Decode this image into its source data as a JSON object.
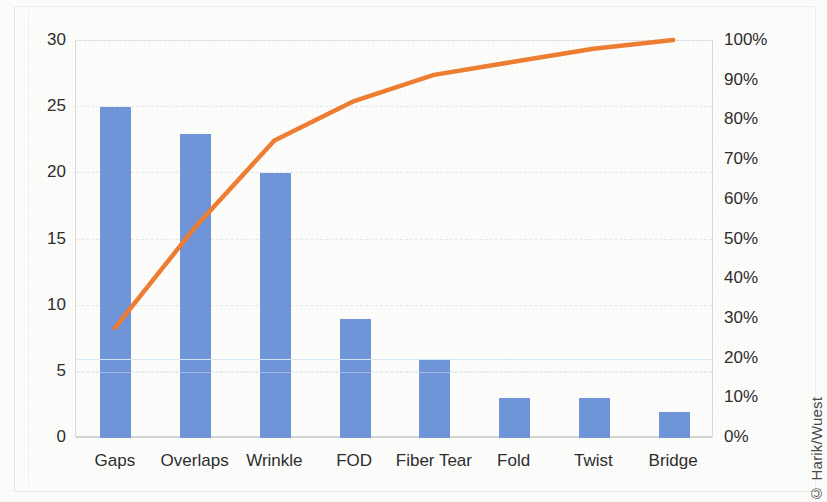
{
  "credit": "© Harik/Wuest",
  "colors": {
    "bar": "#6f94d8",
    "line": "#ed7d31",
    "grid": "#e3e6ea",
    "axis_text": "#2d2d2d",
    "background": "#fdfdfc"
  },
  "chart_data": {
    "type": "bar",
    "chart_kind": "pareto",
    "title": "",
    "subtitle": "",
    "xlabel": "",
    "ylabel": "",
    "y2label": "",
    "grid": true,
    "legend": "none",
    "categories": [
      "Gaps",
      "Overlaps",
      "Wrinkle",
      "FOD",
      "Fiber Tear",
      "Fold",
      "Twist",
      "Bridge"
    ],
    "values": [
      25,
      23,
      20,
      9,
      6,
      3,
      3,
      2
    ],
    "cumulative_percent": [
      27.5,
      52.7,
      74.7,
      84.6,
      91.2,
      94.5,
      97.8,
      100.0
    ],
    "total": 91,
    "ylim": [
      0,
      30
    ],
    "y2lim": [
      0,
      100
    ],
    "yticks": [
      0,
      5,
      10,
      15,
      20,
      25,
      30
    ],
    "y2ticks": [
      0,
      10,
      20,
      30,
      40,
      50,
      60,
      70,
      80,
      90,
      100
    ],
    "ytick_labels": [
      "0",
      "5",
      "10",
      "15",
      "20",
      "25",
      "30"
    ],
    "y2tick_labels": [
      "0%",
      "10%",
      "20%",
      "30%",
      "40%",
      "50%",
      "60%",
      "70%",
      "80%",
      "90%",
      "100%"
    ],
    "series": [
      {
        "name": "Count",
        "type": "bar",
        "values": [
          25,
          23,
          20,
          9,
          6,
          3,
          3,
          2
        ]
      },
      {
        "name": "Cumulative %",
        "type": "line",
        "axis": "right",
        "values": [
          27.5,
          52.7,
          74.7,
          84.6,
          91.2,
          94.5,
          97.8,
          100.0
        ]
      }
    ]
  }
}
